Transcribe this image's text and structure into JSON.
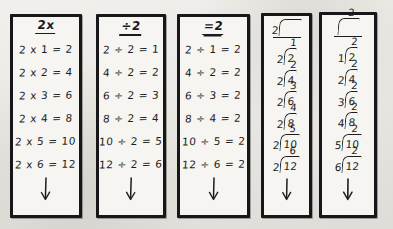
{
  "worksheet": {
    "title": "Multiplication and division fact family columns for the number 2",
    "background_color": "#e9e8e4",
    "ink_color": "#1d1d20",
    "card_color": "#f6f5f2",
    "border_color": "#17171a"
  },
  "columns": [
    {
      "id": "times-two",
      "header": "2x",
      "style": "equation",
      "rows": [
        "2 x 1 = 2",
        "2 x 2 = 4",
        "2 x 3 = 6",
        "2 x 4 = 8",
        "2 x 5 = 10",
        "2 x 6 = 12"
      ],
      "arrow": "down-arrow"
    },
    {
      "id": "divide-by-two",
      "header": "÷2",
      "style": "equation",
      "rows": [
        "2 ÷ 2 = 1",
        "4 ÷ 2 = 2",
        "6 ÷ 2 = 3",
        "8 ÷ 2 = 4",
        "10 ÷ 2 = 5",
        "12 ÷ 2 = 6"
      ],
      "arrow": "down-arrow"
    },
    {
      "id": "equals-two",
      "header": "=2",
      "style": "equation",
      "rows": [
        "2 ÷ 1 = 2",
        "4 ÷ 2 = 2",
        "6 ÷ 3 = 2",
        "8 ÷ 4 = 2",
        "10 ÷ 5 = 2",
        "12 ÷ 6 = 2"
      ],
      "arrow": "down-arrow"
    },
    {
      "id": "long-division-divisor-two",
      "header_divisor": "2",
      "header_quotient": "",
      "header_dividend": "",
      "style": "long-division",
      "rows": [
        {
          "divisor": "2",
          "dividend": "2",
          "quotient": "1"
        },
        {
          "divisor": "2",
          "dividend": "4",
          "quotient": "2"
        },
        {
          "divisor": "2",
          "dividend": "6",
          "quotient": "3"
        },
        {
          "divisor": "2",
          "dividend": "8",
          "quotient": "4"
        },
        {
          "divisor": "2",
          "dividend": "10",
          "quotient": "5"
        },
        {
          "divisor": "2",
          "dividend": "12",
          "quotient": "6"
        }
      ],
      "arrow": "down-arrow"
    },
    {
      "id": "long-division-quotient-two",
      "header_divisor": "",
      "header_quotient": "2",
      "header_dividend": "",
      "style": "long-division",
      "rows": [
        {
          "divisor": "1",
          "dividend": "2",
          "quotient": "2"
        },
        {
          "divisor": "2",
          "dividend": "4",
          "quotient": "2"
        },
        {
          "divisor": "3",
          "dividend": "6",
          "quotient": "2"
        },
        {
          "divisor": "4",
          "dividend": "8",
          "quotient": "2"
        },
        {
          "divisor": "5",
          "dividend": "10",
          "quotient": "2"
        },
        {
          "divisor": "6",
          "dividend": "12",
          "quotient": "2"
        }
      ],
      "arrow": "down-arrow"
    }
  ]
}
